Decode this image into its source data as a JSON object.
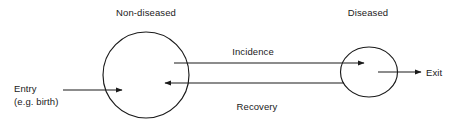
{
  "diagram": {
    "type": "compartmental-flow-diagram",
    "background_color": "#ffffff",
    "stroke_color": "#1a1a1a",
    "text_color": "#1a1a1a",
    "nodes": [
      {
        "id": "non-diseased",
        "label": "Non-diseased",
        "shape": "circle",
        "cx": 146,
        "cy": 75,
        "rx": 43,
        "ry": 43
      },
      {
        "id": "diseased",
        "label": "Diseased",
        "shape": "ellipse",
        "cx": 369,
        "cy": 72,
        "rx": 28,
        "ry": 25
      }
    ],
    "flows": [
      {
        "id": "incidence",
        "label": "Incidence",
        "from": "non-diseased",
        "to": "diseased",
        "direction": "left-to-right"
      },
      {
        "id": "recovery",
        "label": "Recovery",
        "from": "diseased",
        "to": "non-diseased",
        "direction": "right-to-left"
      }
    ],
    "endpoints": [
      {
        "id": "entry",
        "label": "Entry",
        "sublabel": "(e.g. birth)",
        "target": "non-diseased",
        "direction": "inflow"
      },
      {
        "id": "exit",
        "label": "Exit",
        "source": "diseased",
        "direction": "outflow"
      }
    ]
  }
}
